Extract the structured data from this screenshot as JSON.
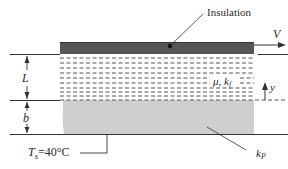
{
  "figure": {
    "type": "physical schematic"
  },
  "labels": {
    "insulation": "Insulation",
    "velocity": "V",
    "fluid_thickness": "L",
    "plate_thickness": "b",
    "coordinate": "y",
    "fluid_props_mu": "μ",
    "fluid_props_sep": ", ",
    "fluid_props_k": "k",
    "fluid_props_k_sub": "f",
    "plate_k": "k",
    "plate_k_sub": "P",
    "surface_temp_T": "T",
    "surface_temp_sub": "s",
    "surface_temp_value": "=40°C"
  },
  "colors": {
    "insulation_plate": "#555555",
    "solid_plate": "#cfcfcf",
    "lines": "#333333",
    "fluid_dashes": "#555555"
  }
}
